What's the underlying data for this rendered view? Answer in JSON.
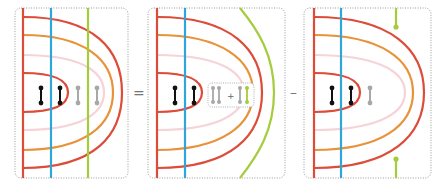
{
  "colors": {
    "red": "#dd4b39",
    "orange": "#e8923a",
    "pink": "#f6d3d8",
    "blue": "#2fa7d6",
    "green": "#a5cc3a",
    "black": "#111111",
    "gray": "#a8a8a8",
    "frame": "#9a9a9a"
  },
  "operators": {
    "equals": "=",
    "minus": "–",
    "plus": "+"
  },
  "panels": [
    {
      "id": "lhs",
      "green_line": "straight-vertical",
      "dumbbells": [
        "black",
        "black",
        "gray",
        "gray"
      ]
    },
    {
      "id": "term1",
      "green_line": "curved-around",
      "dumbbells": [
        "black",
        "black"
      ],
      "inset": [
        "gray",
        "gray",
        "+",
        "gray",
        "green"
      ]
    },
    {
      "id": "term2",
      "green_line": "stubs-top-bottom",
      "dumbbells": [
        "black",
        "black",
        "gray"
      ]
    }
  ]
}
